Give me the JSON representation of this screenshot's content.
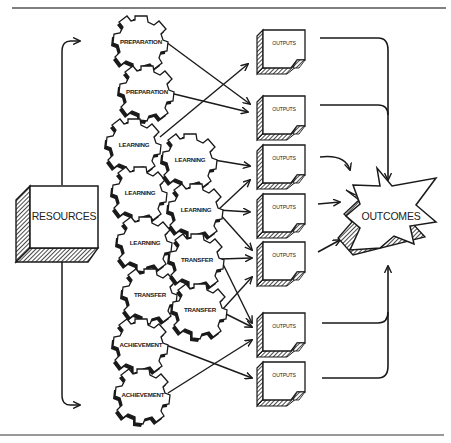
{
  "diagram": {
    "type": "flow",
    "colors": {
      "ink": "#1a1a1a",
      "paper": "#ffffff",
      "rule": "#555555"
    },
    "resources": {
      "label": "RESOURCES"
    },
    "outcomes": {
      "label": "OUTCOMES"
    },
    "gears": [
      {
        "id": "g1",
        "label": "PREPARATION",
        "column": 1
      },
      {
        "id": "g2",
        "label": "PREPARATION",
        "column": 1
      },
      {
        "id": "g3",
        "label": "LEARNING",
        "column": 1
      },
      {
        "id": "g4",
        "label": "LEARNING",
        "column": 1
      },
      {
        "id": "g5",
        "label": "LEARNING",
        "column": 1
      },
      {
        "id": "g6",
        "label": "TRANSFER",
        "column": 1
      },
      {
        "id": "g7",
        "label": "ACHIEVEMENT",
        "column": 1
      },
      {
        "id": "g8",
        "label": "ACHIEVEMENT",
        "column": 1
      },
      {
        "id": "g9",
        "label": "LEARNING",
        "column": 2
      },
      {
        "id": "g10",
        "label": "LEARNING",
        "column": 2
      },
      {
        "id": "g11",
        "label": "TRANSFER",
        "column": 2
      },
      {
        "id": "g12",
        "label": "TRANSFER",
        "column": 2
      }
    ],
    "outputs": [
      {
        "id": "o1",
        "label": "OUTPUTS"
      },
      {
        "id": "o2",
        "label": "OUTPUTS"
      },
      {
        "id": "o3",
        "label": "OUTPUTS"
      },
      {
        "id": "o4",
        "label": "OUTPUTS"
      },
      {
        "id": "o5",
        "label": "OUTPUTS"
      },
      {
        "id": "o6",
        "label": "OUTPUTS"
      },
      {
        "id": "o7",
        "label": "OUTPUTS"
      }
    ],
    "edges": [
      {
        "from": "resources",
        "to": "gears-top"
      },
      {
        "from": "resources",
        "to": "gears-bottom"
      },
      {
        "from": "g1",
        "to": "o2"
      },
      {
        "from": "g2",
        "to": "o2"
      },
      {
        "from": "g3",
        "to": "o1"
      },
      {
        "from": "g9",
        "to": "o3"
      },
      {
        "from": "g10",
        "to": "o3"
      },
      {
        "from": "g10",
        "to": "o4"
      },
      {
        "from": "g10",
        "to": "o5"
      },
      {
        "from": "g11",
        "to": "o5"
      },
      {
        "from": "g11",
        "to": "o6"
      },
      {
        "from": "g12",
        "to": "o4"
      },
      {
        "from": "g12",
        "to": "o6"
      },
      {
        "from": "g7",
        "to": "o7"
      },
      {
        "from": "g8",
        "to": "o5"
      },
      {
        "from": "o1",
        "to": "outcomes"
      },
      {
        "from": "o2",
        "to": "outcomes"
      },
      {
        "from": "o3",
        "to": "outcomes"
      },
      {
        "from": "o4",
        "to": "outcomes"
      },
      {
        "from": "o5",
        "to": "outcomes"
      },
      {
        "from": "o6",
        "to": "outcomes"
      },
      {
        "from": "o7",
        "to": "outcomes"
      }
    ]
  }
}
